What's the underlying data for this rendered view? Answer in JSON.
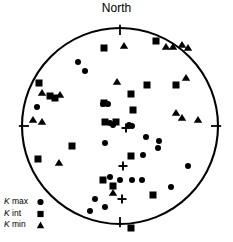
{
  "figure": {
    "title": "North",
    "type": "stereonet-equal-area-lower-hemisphere",
    "background_color": "#ffffff",
    "marker_color": "#000000",
    "outline_color": "#000000"
  },
  "legend": {
    "position": "bottom-left",
    "items": [
      {
        "prefix": "K",
        "label": " max",
        "symbol": "circle-marker",
        "symbol_glyph": "●"
      },
      {
        "prefix": "K",
        "label": " int",
        "symbol": "square-marker",
        "symbol_glyph": "■"
      },
      {
        "prefix": "K",
        "label": " min",
        "symbol": "triangle-marker",
        "symbol_glyph": "▲"
      }
    ]
  },
  "chart_data": {
    "type": "scatter",
    "title": "North",
    "projection": "equal-area stereographic (lower hemisphere)",
    "xlabel": "",
    "ylabel": "",
    "grid": false,
    "legend_position": "bottom-left",
    "axis_ticks": [
      "N",
      "E",
      "S",
      "W"
    ],
    "circle": {
      "cx": 120,
      "cy": 126,
      "r": 98
    },
    "series": [
      {
        "name": "K max",
        "marker": "circle",
        "color": "#000000",
        "size": 6.0,
        "points": [
          [
            78,
            62
          ],
          [
            85,
            71
          ],
          [
            37,
            107
          ],
          [
            103,
            104
          ],
          [
            108,
            104
          ],
          [
            110,
            123
          ],
          [
            113,
            125
          ],
          [
            129,
            125
          ],
          [
            132,
            126
          ],
          [
            105,
            143
          ],
          [
            146,
            137
          ],
          [
            159,
            141
          ],
          [
            143,
            155
          ],
          [
            188,
            166
          ],
          [
            110,
            177
          ],
          [
            120,
            180
          ],
          [
            132,
            180
          ],
          [
            142,
            180
          ],
          [
            171,
            187
          ],
          [
            95,
            199
          ],
          [
            105,
            207
          ],
          [
            90,
            211
          ],
          [
            158,
            148
          ]
        ]
      },
      {
        "name": "K int",
        "marker": "square",
        "color": "#000000",
        "size": 7.0,
        "points": [
          [
            104,
            48
          ],
          [
            156,
            41
          ],
          [
            39,
            83
          ],
          [
            50,
            96
          ],
          [
            55,
            98
          ],
          [
            147,
            85
          ],
          [
            131,
            94
          ],
          [
            176,
            85
          ],
          [
            104,
            103
          ],
          [
            133,
            110
          ],
          [
            105,
            122
          ],
          [
            116,
            122
          ],
          [
            72,
            146
          ],
          [
            38,
            159
          ],
          [
            131,
            156
          ],
          [
            103,
            180
          ],
          [
            113,
            186
          ],
          [
            153,
            195
          ],
          [
            131,
            228
          ]
        ]
      },
      {
        "name": "K min",
        "marker": "triangle",
        "color": "#000000",
        "size": 7.0,
        "points": [
          [
            124,
            46
          ],
          [
            166,
            47
          ],
          [
            173,
            47
          ],
          [
            182,
            45
          ],
          [
            188,
            48
          ],
          [
            117,
            82
          ],
          [
            42,
            93
          ],
          [
            60,
            95
          ],
          [
            186,
            78
          ],
          [
            33,
            120
          ],
          [
            42,
            122
          ],
          [
            176,
            113
          ],
          [
            182,
            118
          ],
          [
            198,
            120
          ],
          [
            59,
            163
          ],
          [
            113,
            193
          ]
        ]
      },
      {
        "name": "mean-cross",
        "marker": "plus",
        "color": "#000000",
        "size": 9.0,
        "points": [
          [
            123,
            166
          ],
          [
            122,
            199
          ],
          [
            126,
            128
          ]
        ]
      }
    ]
  }
}
